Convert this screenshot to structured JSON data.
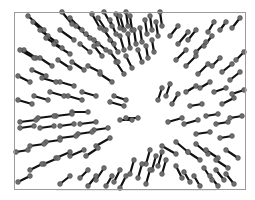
{
  "chart_data": {
    "type": "scatter",
    "subtype": "vector-field-dumbbell",
    "title": "",
    "xlabel": "",
    "ylabel": "",
    "grid": false,
    "legend": null,
    "frame": {
      "x": 14,
      "y": 12,
      "width": 231,
      "height": 177
    },
    "center": {
      "x": 148,
      "y": 112
    },
    "style": {
      "line_color": "#111111",
      "marker_color": "#6e6e6e",
      "frame_color": "#9a9a9a",
      "marker_radius": 2.4
    },
    "segments": [
      [
        28,
        16,
        44,
        30
      ],
      [
        33,
        22,
        48,
        36
      ],
      [
        40,
        30,
        56,
        42
      ],
      [
        46,
        38,
        62,
        48
      ],
      [
        54,
        44,
        70,
        54
      ],
      [
        62,
        12,
        72,
        24
      ],
      [
        70,
        18,
        82,
        30
      ],
      [
        76,
        26,
        90,
        38
      ],
      [
        60,
        30,
        74,
        40
      ],
      [
        92,
        14,
        100,
        28
      ],
      [
        98,
        18,
        106,
        30
      ],
      [
        104,
        12,
        112,
        26
      ],
      [
        110,
        20,
        116,
        34
      ],
      [
        116,
        14,
        120,
        28
      ],
      [
        120,
        16,
        124,
        30
      ],
      [
        126,
        12,
        128,
        26
      ],
      [
        130,
        16,
        132,
        30
      ],
      [
        86,
        34,
        98,
        44
      ],
      [
        94,
        40,
        106,
        50
      ],
      [
        104,
        30,
        114,
        44
      ],
      [
        110,
        40,
        118,
        52
      ],
      [
        120,
        36,
        124,
        50
      ],
      [
        128,
        34,
        130,
        48
      ],
      [
        134,
        30,
        136,
        44
      ],
      [
        140,
        28,
        142,
        42
      ],
      [
        145,
        20,
        147,
        34
      ],
      [
        150,
        16,
        152,
        30
      ],
      [
        156,
        22,
        158,
        36
      ],
      [
        160,
        12,
        162,
        26
      ],
      [
        138,
        50,
        142,
        62
      ],
      [
        146,
        46,
        148,
        58
      ],
      [
        152,
        40,
        154,
        52
      ],
      [
        170,
        36,
        178,
        26
      ],
      [
        178,
        44,
        188,
        32
      ],
      [
        188,
        40,
        196,
        30
      ],
      [
        196,
        52,
        206,
        42
      ],
      [
        204,
        46,
        212,
        36
      ],
      [
        208,
        32,
        214,
        22
      ],
      [
        220,
        30,
        226,
        22
      ],
      [
        232,
        28,
        240,
        18
      ],
      [
        176,
        60,
        186,
        50
      ],
      [
        186,
        66,
        196,
        56
      ],
      [
        198,
        74,
        208,
        64
      ],
      [
        212,
        66,
        220,
        58
      ],
      [
        222,
        72,
        232,
        64
      ],
      [
        230,
        80,
        240,
        72
      ],
      [
        236,
        60,
        244,
        52
      ],
      [
        186,
        92,
        196,
        86
      ],
      [
        200,
        88,
        210,
        82
      ],
      [
        214,
        92,
        226,
        88
      ],
      [
        222,
        104,
        234,
        98
      ],
      [
        232,
        94,
        244,
        90
      ],
      [
        190,
        106,
        202,
        104
      ],
      [
        168,
        122,
        182,
        118
      ],
      [
        184,
        124,
        198,
        120
      ],
      [
        206,
        116,
        218,
        114
      ],
      [
        216,
        124,
        228,
        122
      ],
      [
        230,
        118,
        242,
        116
      ],
      [
        196,
        134,
        210,
        132
      ],
      [
        220,
        138,
        232,
        136
      ],
      [
        162,
        146,
        176,
        154
      ],
      [
        176,
        142,
        188,
        152
      ],
      [
        188,
        152,
        200,
        160
      ],
      [
        196,
        144,
        208,
        154
      ],
      [
        206,
        150,
        218,
        158
      ],
      [
        216,
        160,
        228,
        168
      ],
      [
        226,
        150,
        238,
        158
      ],
      [
        204,
        168,
        212,
        180
      ],
      [
        210,
        176,
        218,
        186
      ],
      [
        216,
        170,
        224,
        180
      ],
      [
        226,
        174,
        234,
        184
      ],
      [
        176,
        166,
        182,
        178
      ],
      [
        184,
        172,
        190,
        182
      ],
      [
        194,
        176,
        200,
        186
      ],
      [
        150,
        150,
        146,
        164
      ],
      [
        156,
        156,
        152,
        170
      ],
      [
        162,
        152,
        158,
        166
      ],
      [
        166,
        160,
        162,
        174
      ],
      [
        142,
        164,
        138,
        178
      ],
      [
        150,
        170,
        146,
        184
      ],
      [
        134,
        160,
        130,
        174
      ],
      [
        120,
        170,
        114,
        182
      ],
      [
        126,
        176,
        120,
        188
      ],
      [
        112,
        176,
        106,
        186
      ],
      [
        104,
        168,
        96,
        180
      ],
      [
        96,
        176,
        88,
        186
      ],
      [
        88,
        170,
        80,
        178
      ],
      [
        70,
        176,
        60,
        184
      ],
      [
        110,
        138,
        96,
        146
      ],
      [
        98,
        148,
        86,
        156
      ],
      [
        84,
        150,
        70,
        156
      ],
      [
        70,
        152,
        56,
        158
      ],
      [
        58,
        158,
        44,
        164
      ],
      [
        42,
        164,
        30,
        170
      ],
      [
        30,
        176,
        18,
        182
      ],
      [
        108,
        128,
        94,
        130
      ],
      [
        92,
        132,
        78,
        134
      ],
      [
        76,
        136,
        60,
        138
      ],
      [
        60,
        140,
        46,
        142
      ],
      [
        44,
        144,
        30,
        146
      ],
      [
        28,
        150,
        16,
        152
      ],
      [
        96,
        122,
        80,
        124
      ],
      [
        88,
        112,
        72,
        112
      ],
      [
        72,
        114,
        56,
        116
      ],
      [
        54,
        116,
        38,
        118
      ],
      [
        36,
        120,
        20,
        122
      ],
      [
        20,
        128,
        34,
        126
      ],
      [
        40,
        128,
        54,
        126
      ],
      [
        60,
        126,
        74,
        124
      ],
      [
        96,
        96,
        82,
        92
      ],
      [
        82,
        100,
        68,
        96
      ],
      [
        64,
        96,
        50,
        92
      ],
      [
        48,
        100,
        34,
        96
      ],
      [
        32,
        104,
        18,
        100
      ],
      [
        74,
        86,
        60,
        82
      ],
      [
        56,
        82,
        42,
        78
      ],
      [
        112,
        82,
        100,
        74
      ],
      [
        100,
        72,
        88,
        66
      ],
      [
        84,
        70,
        72,
        62
      ],
      [
        70,
        68,
        58,
        60
      ],
      [
        52,
        66,
        40,
        58
      ],
      [
        36,
        58,
        24,
        50
      ],
      [
        20,
        50,
        34,
        58
      ],
      [
        124,
        74,
        116,
        62
      ],
      [
        132,
        68,
        126,
        56
      ],
      [
        118,
        62,
        110,
        52
      ],
      [
        102,
        56,
        94,
        46
      ],
      [
        90,
        52,
        80,
        44
      ],
      [
        46,
        76,
        32,
        70
      ],
      [
        30,
        82,
        18,
        76
      ],
      [
        120,
        120,
        132,
        120
      ],
      [
        126,
        118,
        138,
        118
      ],
      [
        110,
        102,
        124,
        106
      ],
      [
        114,
        96,
        126,
        100
      ],
      [
        158,
        100,
        162,
        88
      ],
      [
        166,
        96,
        170,
        84
      ],
      [
        172,
        104,
        178,
        94
      ]
    ]
  }
}
